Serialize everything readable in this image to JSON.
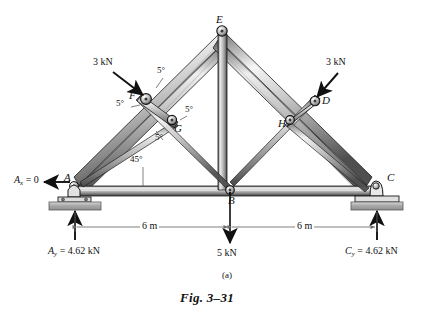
{
  "figure": {
    "caption": "Fig. 3–31",
    "part_label": "(a)",
    "type": "truss-free-body-diagram"
  },
  "joints": [
    {
      "id": "A",
      "label": "A",
      "x": 72,
      "y": 183
    },
    {
      "id": "B",
      "label": "B",
      "x": 232,
      "y": 194
    },
    {
      "id": "C",
      "label": "C",
      "x": 375,
      "y": 182
    },
    {
      "id": "E",
      "label": "E",
      "x": 222,
      "y": 27
    },
    {
      "id": "F",
      "label": "F",
      "x": 139,
      "y": 99
    },
    {
      "id": "G",
      "label": "G",
      "x": 176,
      "y": 125
    },
    {
      "id": "D",
      "label": "D",
      "x": 320,
      "y": 102
    },
    {
      "id": "H",
      "label": "H",
      "x": 289,
      "y": 124
    }
  ],
  "angles": [
    {
      "value": "5°",
      "x": 160,
      "y": 70
    },
    {
      "value": "5°",
      "x": 122,
      "y": 104
    },
    {
      "value": "5°",
      "x": 186,
      "y": 109
    },
    {
      "value": "5°",
      "x": 158,
      "y": 138
    },
    {
      "value": "45°",
      "x": 136,
      "y": 159
    }
  ],
  "forces": [
    {
      "label": "3 kN",
      "x": 99,
      "y": 62,
      "target": "F"
    },
    {
      "label": "3 kN",
      "x": 322,
      "y": 62,
      "target": "D"
    },
    {
      "label": "5 kN",
      "x": 219,
      "y": 252,
      "target": "B"
    }
  ],
  "reactions": [
    {
      "id": "Ax",
      "text_prefix": "A",
      "sub": "x",
      "text_suffix": " = 0",
      "x": 20,
      "y": 178
    },
    {
      "id": "Ay",
      "text_prefix": "A",
      "sub": "y",
      "text_suffix": " = 4.62 kN",
      "x": 60,
      "y": 249
    },
    {
      "id": "Cy",
      "text_prefix": "C",
      "sub": "y",
      "text_suffix": " = 4.62 kN",
      "x": 317,
      "y": 249
    }
  ],
  "dimensions": [
    {
      "label": "6 m",
      "x": 137,
      "y": 222
    },
    {
      "label": "6 m",
      "x": 300,
      "y": 222
    }
  ],
  "colors": {
    "member_light": "#f2f2f2",
    "member_mid": "#9a9a9a",
    "member_dark": "#4a4a4a",
    "outline": "#1a1a1a",
    "support_plate": "#b0b0b0",
    "text": "#111111",
    "dim_line": "#7a7a7a"
  }
}
